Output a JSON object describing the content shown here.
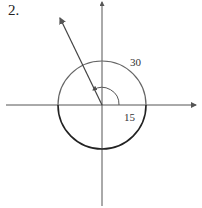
{
  "problem": {
    "number": "2."
  },
  "diagram": {
    "type": "angle-in-standard-position",
    "labels": {
      "outer_radius": "30",
      "inner_radius": "15"
    },
    "colors": {
      "axis": "#555555",
      "circle": "#222222",
      "arc": "#555555",
      "ray": "#444444"
    }
  }
}
